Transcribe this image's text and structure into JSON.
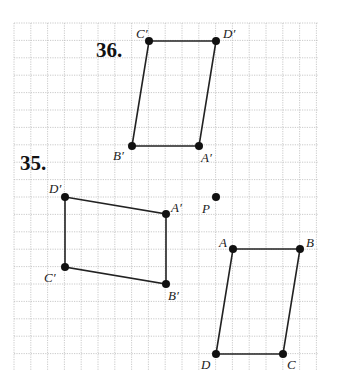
{
  "grid": {
    "x0": 14,
    "y0": 23,
    "x1": 318,
    "y1": 370,
    "dx": 16.8,
    "dy": 17.4,
    "color": "#bdbdbd"
  },
  "problems": [
    {
      "label": "36.",
      "x": 96,
      "y": 57,
      "points": [
        {
          "name": "C′",
          "x": 149,
          "y": 41,
          "lx": 136,
          "ly": 38
        },
        {
          "name": "D′",
          "x": 216,
          "y": 41,
          "lx": 223,
          "ly": 38
        },
        {
          "name": "A′",
          "x": 199,
          "y": 146,
          "lx": 201,
          "ly": 162
        },
        {
          "name": "B′",
          "x": 132,
          "y": 146,
          "lx": 113,
          "ly": 160
        }
      ],
      "order": [
        "C′",
        "D′",
        "A′",
        "B′"
      ]
    },
    {
      "label": "35.",
      "x": 20,
      "y": 170,
      "points": [
        {
          "name": "D′",
          "x": 65,
          "y": 197,
          "lx": 49,
          "ly": 193
        },
        {
          "name": "A′",
          "x": 166,
          "y": 214,
          "lx": 171,
          "ly": 212
        },
        {
          "name": "B′",
          "x": 166,
          "y": 284,
          "lx": 168,
          "ly": 300
        },
        {
          "name": "C′",
          "x": 65,
          "y": 267,
          "lx": 44,
          "ly": 282
        }
      ],
      "order": [
        "D′",
        "A′",
        "B′",
        "C′"
      ]
    }
  ],
  "original": {
    "points": [
      {
        "name": "A",
        "x": 233,
        "y": 249,
        "lx": 219,
        "ly": 247
      },
      {
        "name": "B",
        "x": 300,
        "y": 249,
        "lx": 306,
        "ly": 247
      },
      {
        "name": "C",
        "x": 283,
        "y": 354,
        "lx": 287,
        "ly": 369
      },
      {
        "name": "D",
        "x": 216,
        "y": 354,
        "lx": 201,
        "ly": 369
      }
    ],
    "order": [
      "A",
      "B",
      "C",
      "D"
    ]
  },
  "center": {
    "name": "P",
    "x": 216,
    "y": 197,
    "lx": 202,
    "ly": 213
  }
}
